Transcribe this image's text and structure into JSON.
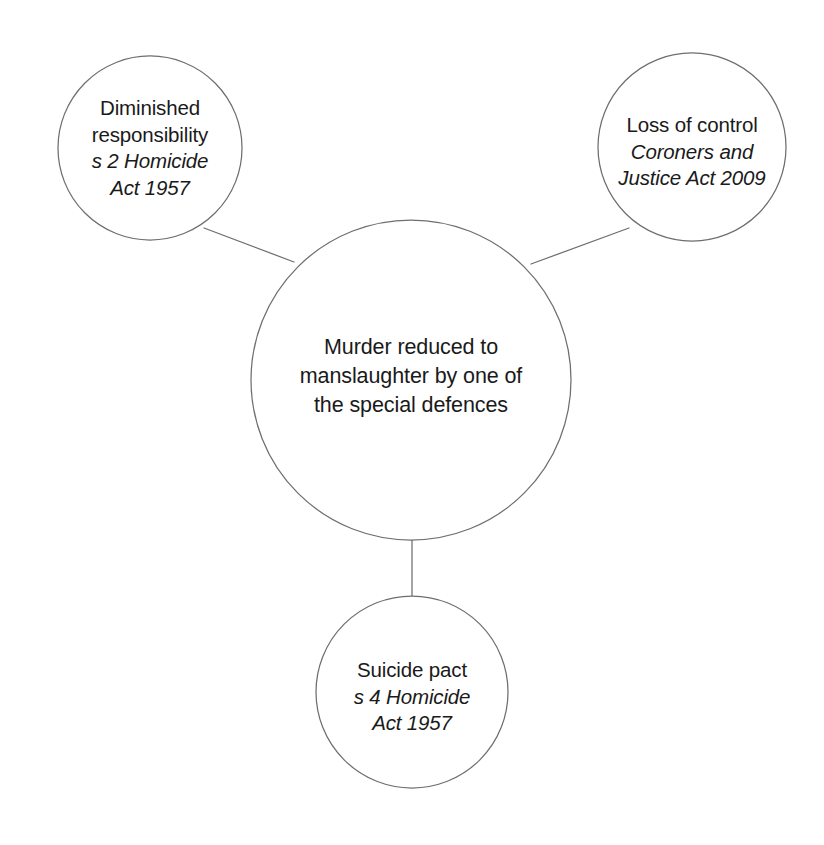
{
  "diagram": {
    "title": "Murder reduced to manslaughter by one of the special defences",
    "type": "hub-and-spoke concept map",
    "stroke_color": "#6e6e6e",
    "text_color": "#1a1a1a",
    "background_color": "#ffffff",
    "central_node": {
      "id": "central",
      "line1": "Murder reduced to",
      "line2": "manslaughter by one of",
      "line3": "the special defences",
      "cx": 411,
      "cy": 380,
      "r": 160
    },
    "nodes": [
      {
        "id": "diminished-responsibility",
        "title_line1": "Diminished",
        "title_line2": "responsibility",
        "statute_line1": "s 2 Homicide",
        "statute_line2": "Act 1957",
        "cx": 150,
        "cy": 148,
        "r": 92
      },
      {
        "id": "loss-of-control",
        "title_line1": "Loss of control",
        "title_line2": "",
        "statute_line1": "Coroners and",
        "statute_line2": "Justice Act 2009",
        "cx": 692,
        "cy": 147,
        "r": 94
      },
      {
        "id": "suicide-pact",
        "title_line1": "Suicide pact",
        "title_line2": "",
        "statute_line1": "s 4 Homicide",
        "statute_line2": "Act 1957",
        "cx": 412,
        "cy": 692,
        "r": 96
      }
    ],
    "connectors": [
      {
        "id": "connector-diminished-responsibility",
        "x1": 204,
        "y1": 228,
        "x2": 294,
        "y2": 262
      },
      {
        "id": "connector-loss-of-control",
        "x1": 629,
        "y1": 228,
        "x2": 531,
        "y2": 264
      },
      {
        "id": "connector-suicide-pact",
        "x1": 412,
        "y1": 540,
        "x2": 412,
        "y2": 596
      }
    ]
  }
}
